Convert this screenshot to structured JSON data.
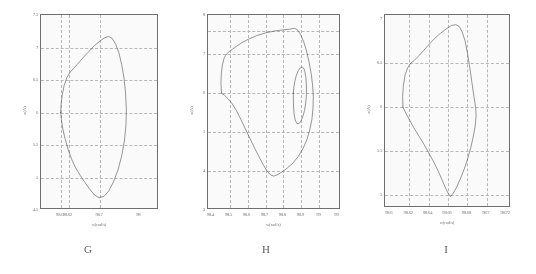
{
  "figure": {
    "background": "#ffffff",
    "curve_color": "#555555",
    "grid_color": "#b9b9b9",
    "axis_color": "#6b6b6b"
  },
  "panels": [
    {
      "letter": "G",
      "xtitle": "w(rad/s)",
      "ytitle": "x(A)",
      "xticks": [
        "98.6",
        "98.62",
        "98.7",
        "98"
      ],
      "xtick_values": [
        98.6,
        98.62,
        98.7,
        98.8
      ],
      "yticks": [
        "7.5",
        "7",
        "6.5",
        "6",
        "5.5",
        "5",
        "4.5"
      ],
      "ytick_values": [
        7.5,
        7,
        6.5,
        6,
        5.5,
        5,
        4.5
      ],
      "xlim": [
        98.55,
        98.85
      ],
      "ylim": [
        4.5,
        7.5
      ],
      "gridlines_x": [
        98.6,
        98.62,
        98.7
      ],
      "gridlines_y": [
        7,
        6.5,
        6,
        5.5,
        5
      ],
      "loops": [
        {
          "name": "outer-loop",
          "points": [
            [
              98.6,
              6.0
            ],
            [
              98.601,
              6.12
            ],
            [
              98.604,
              6.27
            ],
            [
              98.609,
              6.42
            ],
            [
              98.616,
              6.54
            ],
            [
              98.624,
              6.62
            ],
            [
              98.633,
              6.68
            ],
            [
              98.645,
              6.76
            ],
            [
              98.658,
              6.85
            ],
            [
              98.672,
              6.94
            ],
            [
              98.686,
              7.03
            ],
            [
              98.7,
              7.1
            ],
            [
              98.712,
              7.15
            ],
            [
              98.722,
              7.17
            ],
            [
              98.731,
              7.14
            ],
            [
              98.74,
              7.05
            ],
            [
              98.748,
              6.92
            ],
            [
              98.755,
              6.74
            ],
            [
              98.761,
              6.53
            ],
            [
              98.765,
              6.3
            ],
            [
              98.767,
              6.05
            ],
            [
              98.766,
              5.8
            ],
            [
              98.762,
              5.56
            ],
            [
              98.755,
              5.33
            ],
            [
              98.746,
              5.12
            ],
            [
              98.734,
              4.93
            ],
            [
              98.722,
              4.79
            ],
            [
              98.71,
              4.71
            ],
            [
              98.698,
              4.69
            ],
            [
              98.686,
              4.73
            ],
            [
              98.674,
              4.82
            ],
            [
              98.662,
              4.92
            ],
            [
              98.65,
              5.03
            ],
            [
              98.638,
              5.15
            ],
            [
              98.628,
              5.28
            ],
            [
              98.619,
              5.43
            ],
            [
              98.612,
              5.58
            ],
            [
              98.606,
              5.73
            ],
            [
              98.602,
              5.88
            ],
            [
              98.6,
              6.0
            ]
          ]
        }
      ]
    },
    {
      "letter": "H",
      "xtitle": "w(rad/s)",
      "ytitle": "x(A)",
      "xticks": [
        "98.4",
        "98.5",
        "98.6",
        "98.7",
        "98.8",
        "98.9",
        "99",
        "99"
      ],
      "xtick_values": [
        98.4,
        98.5,
        98.6,
        98.7,
        98.8,
        98.9,
        99.0,
        99.1
      ],
      "yticks": [
        "8",
        "7",
        "6",
        "5",
        "4",
        "3"
      ],
      "ytick_values": [
        8,
        7,
        6,
        5,
        4,
        3
      ],
      "xlim": [
        98.38,
        99.12
      ],
      "ylim": [
        3,
        8
      ],
      "gridlines_x": [
        98.5,
        98.6,
        98.7,
        98.8,
        98.9,
        99.0
      ],
      "gridlines_y": [
        7.6,
        7,
        6,
        5,
        4
      ],
      "loops": [
        {
          "name": "outer-loop",
          "points": [
            [
              98.455,
              6.0
            ],
            [
              98.452,
              6.25
            ],
            [
              98.454,
              6.5
            ],
            [
              98.46,
              6.72
            ],
            [
              98.47,
              6.9
            ],
            [
              98.483,
              7.0
            ],
            [
              98.5,
              7.07
            ],
            [
              98.53,
              7.17
            ],
            [
              98.565,
              7.28
            ],
            [
              98.605,
              7.38
            ],
            [
              98.65,
              7.47
            ],
            [
              98.7,
              7.54
            ],
            [
              98.75,
              7.59
            ],
            [
              98.8,
              7.62
            ],
            [
              98.84,
              7.64
            ],
            [
              98.862,
              7.66
            ],
            [
              98.878,
              7.62
            ],
            [
              98.895,
              7.5
            ],
            [
              98.912,
              7.32
            ],
            [
              98.928,
              7.08
            ],
            [
              98.942,
              6.8
            ],
            [
              98.954,
              6.5
            ],
            [
              98.962,
              6.2
            ],
            [
              98.966,
              5.9
            ],
            [
              98.964,
              5.6
            ],
            [
              98.958,
              5.32
            ],
            [
              98.946,
              5.05
            ],
            [
              98.93,
              4.8
            ],
            [
              98.908,
              4.57
            ],
            [
              98.882,
              4.37
            ],
            [
              98.852,
              4.2
            ],
            [
              98.82,
              4.07
            ],
            [
              98.79,
              3.97
            ],
            [
              98.765,
              3.9
            ],
            [
              98.745,
              3.87
            ],
            [
              98.728,
              3.9
            ],
            [
              98.71,
              3.99
            ],
            [
              98.69,
              4.14
            ],
            [
              98.668,
              4.33
            ],
            [
              98.642,
              4.56
            ],
            [
              98.615,
              4.82
            ],
            [
              98.588,
              5.08
            ],
            [
              98.562,
              5.33
            ],
            [
              98.538,
              5.55
            ],
            [
              98.515,
              5.72
            ],
            [
              98.492,
              5.85
            ],
            [
              98.472,
              5.94
            ],
            [
              98.455,
              6.0
            ]
          ]
        },
        {
          "name": "inner-loop",
          "points": [
            [
              98.855,
              6.0
            ],
            [
              98.858,
              6.16
            ],
            [
              98.864,
              6.32
            ],
            [
              98.872,
              6.46
            ],
            [
              98.882,
              6.57
            ],
            [
              98.893,
              6.64
            ],
            [
              98.903,
              6.67
            ],
            [
              98.912,
              6.64
            ],
            [
              98.919,
              6.55
            ],
            [
              98.924,
              6.42
            ],
            [
              98.927,
              6.26
            ],
            [
              98.928,
              6.08
            ],
            [
              98.927,
              5.9
            ],
            [
              98.923,
              5.72
            ],
            [
              98.917,
              5.55
            ],
            [
              98.908,
              5.4
            ],
            [
              98.897,
              5.28
            ],
            [
              98.885,
              5.21
            ],
            [
              98.874,
              5.22
            ],
            [
              98.865,
              5.31
            ],
            [
              98.859,
              5.46
            ],
            [
              98.856,
              5.64
            ],
            [
              98.855,
              5.82
            ],
            [
              98.855,
              6.0
            ]
          ]
        }
      ]
    },
    {
      "letter": "I",
      "xtitle": "w(rad/s)",
      "ytitle": "x(A)",
      "xticks": [
        "98.6",
        "98.62",
        "98.64",
        "98.66",
        "98.68",
        "98.7",
        "98.72"
      ],
      "xtick_values": [
        98.6,
        98.62,
        98.64,
        98.66,
        98.68,
        98.7,
        98.72
      ],
      "yticks": [
        "7",
        "6.5",
        "6",
        "5.5",
        "5"
      ],
      "ytick_values": [
        7,
        6.5,
        6,
        5.5,
        5
      ],
      "xlim": [
        98.595,
        98.725
      ],
      "ylim": [
        4.85,
        7.05
      ],
      "gridlines_x": [
        98.62,
        98.64,
        98.66,
        98.68,
        98.7
      ],
      "gridlines_y": [
        6.5,
        6,
        5.5,
        5
      ],
      "loops": [
        {
          "name": "outer-loop",
          "points": [
            [
              98.6135,
              6.0
            ],
            [
              98.6132,
              6.12
            ],
            [
              98.614,
              6.25
            ],
            [
              98.6158,
              6.37
            ],
            [
              98.6185,
              6.45
            ],
            [
              98.6215,
              6.5
            ],
            [
              98.625,
              6.53
            ],
            [
              98.6295,
              6.58
            ],
            [
              98.6345,
              6.64
            ],
            [
              98.64,
              6.71
            ],
            [
              98.646,
              6.78
            ],
            [
              98.652,
              6.84
            ],
            [
              98.658,
              6.89
            ],
            [
              98.6635,
              6.93
            ],
            [
              98.668,
              6.94
            ],
            [
              98.6715,
              6.92
            ],
            [
              98.6745,
              6.86
            ],
            [
              98.6775,
              6.76
            ],
            [
              98.68,
              6.62
            ],
            [
              98.6825,
              6.45
            ],
            [
              98.6848,
              6.27
            ],
            [
              98.6868,
              6.12
            ],
            [
              98.6885,
              6.0
            ],
            [
              98.689,
              5.9
            ],
            [
              98.688,
              5.78
            ],
            [
              98.686,
              5.66
            ],
            [
              98.6835,
              5.54
            ],
            [
              98.6805,
              5.42
            ],
            [
              98.677,
              5.3
            ],
            [
              98.673,
              5.19
            ],
            [
              98.669,
              5.09
            ],
            [
              98.6655,
              5.02
            ],
            [
              98.6625,
              4.98
            ],
            [
              98.66,
              5.02
            ],
            [
              98.657,
              5.09
            ],
            [
              98.6535,
              5.18
            ],
            [
              98.6495,
              5.28
            ],
            [
              98.645,
              5.38
            ],
            [
              98.64,
              5.48
            ],
            [
              98.635,
              5.58
            ],
            [
              98.63,
              5.67
            ],
            [
              98.625,
              5.76
            ],
            [
              98.6205,
              5.85
            ],
            [
              98.6165,
              5.93
            ],
            [
              98.6135,
              6.0
            ]
          ]
        }
      ]
    }
  ]
}
